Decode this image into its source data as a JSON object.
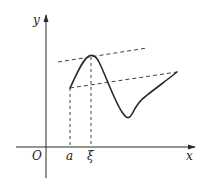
{
  "diagram": {
    "labels": {
      "y_axis": "y",
      "x_axis": "x",
      "origin": "O",
      "point_a": "a",
      "point_xi": "ξ"
    },
    "colors": {
      "stroke": "#2a2a2a",
      "background": "#ffffff"
    },
    "elements": [
      {
        "name": "x-axis",
        "type": "arrow-line"
      },
      {
        "name": "y-axis",
        "type": "arrow-line"
      },
      {
        "name": "curve",
        "type": "solid-curve",
        "from": "a",
        "peak_at": "ξ"
      },
      {
        "name": "secant-line",
        "type": "dashed-line"
      },
      {
        "name": "tangent-line",
        "type": "dashed-line",
        "touches_at": "ξ",
        "parallel_to": "secant-line"
      },
      {
        "name": "a-dropline",
        "type": "dashed-vertical"
      },
      {
        "name": "xi-dropline",
        "type": "dashed-vertical"
      }
    ]
  }
}
